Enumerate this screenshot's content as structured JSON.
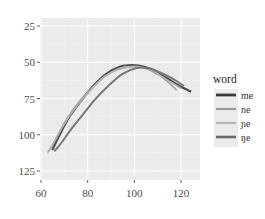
{
  "chart_data": {
    "type": "line",
    "title": "",
    "xlabel": "",
    "ylabel": "",
    "xlim": [
      59,
      128
    ],
    "ylim": [
      135,
      22
    ],
    "y_reversed": true,
    "grid": true,
    "x_ticks": [
      60,
      80,
      100,
      120
    ],
    "y_ticks": [
      25,
      50,
      75,
      100,
      125
    ],
    "legend": {
      "title": "word",
      "position": "right"
    },
    "series": [
      {
        "name": "me",
        "color": "#3a3a3a",
        "width": 2.2,
        "x": [
          65,
          68,
          72,
          77,
          82,
          88,
          94,
          99,
          104,
          109,
          114,
          119,
          124
        ],
        "y": [
          110,
          100,
          88,
          77,
          67,
          58,
          53,
          52,
          53,
          57,
          61,
          66,
          70
        ]
      },
      {
        "name": "ne",
        "color": "#9a9a9a",
        "width": 1.6,
        "x": [
          63,
          66,
          70,
          75,
          81,
          87,
          93,
          99,
          104,
          109,
          114,
          118
        ],
        "y": [
          112,
          104,
          92,
          80,
          69,
          60,
          55,
          53,
          54,
          57,
          63,
          69
        ]
      },
      {
        "name": "ɲe",
        "color": "#b5b5b5",
        "width": 1.6,
        "x": [
          64,
          67,
          71,
          76,
          82,
          88,
          94,
          100,
          105,
          110,
          115,
          120
        ],
        "y": [
          110,
          101,
          90,
          79,
          68,
          59,
          54,
          53,
          54,
          58,
          63,
          68
        ]
      },
      {
        "name": "ŋe",
        "color": "#6a6a6a",
        "width": 2.0,
        "x": [
          66,
          69,
          73,
          78,
          83,
          89,
          95,
          101,
          106,
          111,
          116,
          121
        ],
        "y": [
          111,
          105,
          96,
          86,
          76,
          66,
          58,
          54,
          54,
          57,
          61,
          66
        ]
      }
    ]
  }
}
